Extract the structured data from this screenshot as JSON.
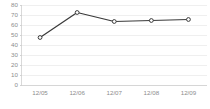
{
  "chart_data": {
    "type": "line",
    "title": "",
    "subtitle": "",
    "xlabel": "",
    "ylabel": "",
    "categories": [
      "12/05",
      "12/06",
      "12/07",
      "12/08",
      "12/09"
    ],
    "values": [
      48,
      73,
      64,
      65,
      66
    ],
    "series": [
      {
        "name": "",
        "values": [
          48,
          73,
          64,
          65,
          66
        ]
      }
    ],
    "ylim": [
      0,
      80
    ],
    "ytick_labels": [
      "0",
      "10",
      "20",
      "30",
      "40",
      "50",
      "60",
      "70",
      "80"
    ],
    "ytick_values": [
      0,
      10,
      20,
      30,
      40,
      50,
      60,
      70,
      80
    ],
    "xtick_labels": [
      "12/05",
      "12/06",
      "12/07",
      "12/08",
      "12/09"
    ],
    "grid": true,
    "grid_axis": "y",
    "legend": false,
    "legend_position": "none",
    "annotations": [],
    "marker": "open-circle",
    "colors": {
      "line": "#3a3a3a",
      "marker_fill": "#ffffff",
      "marker_stroke": "#3a3a3a",
      "gridline": "#e8e8e8",
      "axis": "#d0d0d0",
      "tick_text": "#8c8c8c",
      "background": "#ffffff"
    }
  }
}
